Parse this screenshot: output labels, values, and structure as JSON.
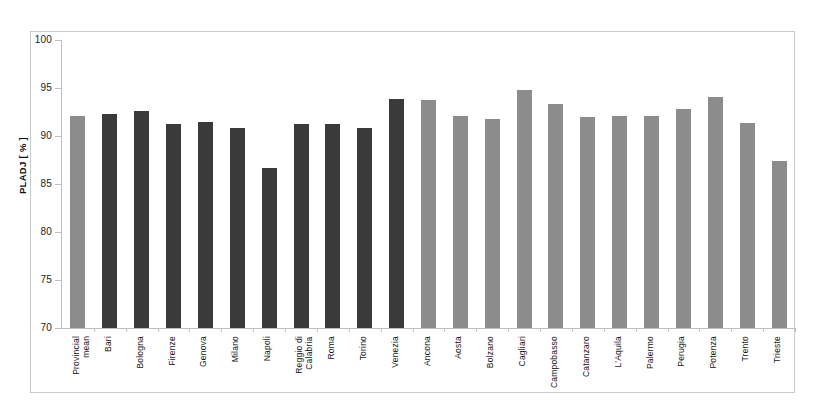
{
  "chart_data": {
    "type": "bar",
    "title": "",
    "xlabel": "",
    "ylabel": "PLADJ [ % ]",
    "ylim": [
      70,
      100
    ],
    "yticks": [
      70,
      75,
      80,
      85,
      90,
      95,
      100
    ],
    "ytick_labels": [
      "70",
      "75",
      "80",
      "85",
      "90",
      "95",
      "100"
    ],
    "grid": false,
    "legend": "none",
    "bar_colors": {
      "dark": "#3a3a3a",
      "light": "#8c8c8c"
    },
    "categories": [
      "Provincial\nmean",
      "Bari",
      "Bologna",
      "Firenze",
      "Genova",
      "Milano",
      "Napoli",
      "Reggio di\nCalabria",
      "Roma",
      "Torino",
      "Venezia",
      "Ancona",
      "Aosta",
      "Bolzano",
      "Cagliari",
      "Campobasso",
      "Catanzaro",
      "L'Aquila",
      "Palermo",
      "Perugia",
      "Potenza",
      "Trento",
      "Trieste"
    ],
    "values": [
      92.1,
      92.3,
      92.6,
      91.3,
      91.5,
      90.8,
      86.7,
      91.2,
      91.2,
      90.8,
      93.9,
      93.7,
      92.1,
      91.8,
      94.8,
      93.3,
      92.0,
      92.1,
      92.1,
      92.8,
      94.1,
      91.4,
      87.4
    ],
    "series_shades": [
      "light",
      "dark",
      "dark",
      "dark",
      "dark",
      "dark",
      "dark",
      "dark",
      "dark",
      "dark",
      "dark",
      "light",
      "light",
      "light",
      "light",
      "light",
      "light",
      "light",
      "light",
      "light",
      "light",
      "light",
      "light"
    ]
  }
}
